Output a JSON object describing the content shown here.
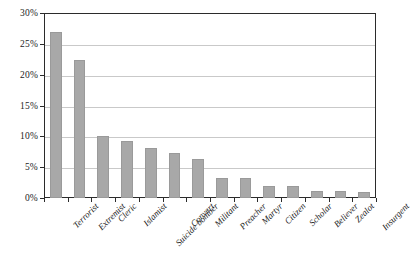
{
  "chart_data": {
    "type": "bar",
    "title": "",
    "subtitle": "",
    "xlabel": "",
    "ylabel": "",
    "ylim": [
      0,
      30
    ],
    "ytick_values": [
      0,
      5,
      10,
      15,
      20,
      25,
      30
    ],
    "ytick_labels": [
      "0%",
      "5%",
      "10%",
      "15%",
      "20%",
      "25%",
      "30%"
    ],
    "grid": true,
    "legend": false,
    "legend_position": "none",
    "value_unit": "%",
    "bar_color": "#a8a8a8",
    "frame_color": "#2b2b2b",
    "gridline_color": "#c9c9c9",
    "categories": [
      "Terrorist",
      "Extremist",
      "Cleric",
      "Islamist",
      "Suicide bomber",
      "Convert",
      "Militant",
      "Preacher",
      "Martyr",
      "Citizen",
      "Scholar",
      "Believer",
      "Zealot",
      "Insurgent"
    ],
    "values": [
      26.9,
      22.4,
      10.0,
      9.2,
      8.1,
      7.3,
      6.3,
      3.2,
      3.2,
      2.0,
      1.9,
      1.2,
      1.1,
      1.0
    ]
  }
}
